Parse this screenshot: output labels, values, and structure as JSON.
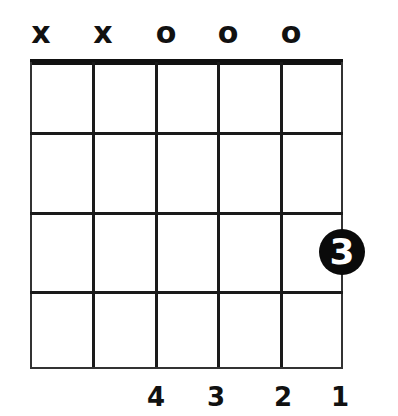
{
  "chord_diagram": {
    "strings_top_marks": [
      "x",
      "x",
      "o",
      "o",
      "o",
      ""
    ],
    "frets_shown": 4,
    "strings": 6,
    "fingered_notes": [
      {
        "string": 6,
        "fret": 3,
        "finger": "3"
      }
    ],
    "finger_labels_bottom": [
      "",
      "",
      "4",
      "3",
      "2",
      "1"
    ]
  }
}
